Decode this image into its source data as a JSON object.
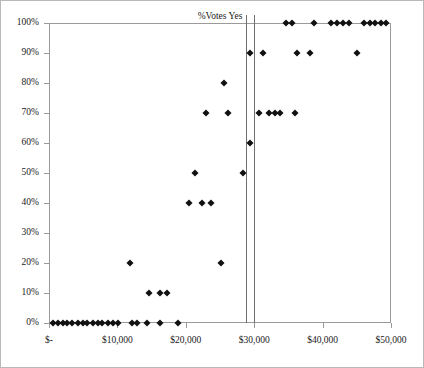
{
  "chart_data": {
    "type": "scatter",
    "title": "%Votes Yes",
    "xlabel": "",
    "ylabel": "",
    "xlim": [
      0,
      50000
    ],
    "ylim": [
      0,
      1.0
    ],
    "grid": false,
    "legend": null,
    "marker": "diamond",
    "marker_color": "#111111",
    "x_ticks": [
      0,
      10000,
      20000,
      30000,
      40000,
      50000
    ],
    "x_tick_labels": [
      "$-",
      "$10,000",
      "$20,000",
      "$30,000",
      "$40,000",
      "$50,000"
    ],
    "y_ticks": [
      0,
      0.1,
      0.2,
      0.3,
      0.4,
      0.5,
      0.6,
      0.7,
      0.8,
      0.9,
      1.0
    ],
    "y_tick_labels": [
      "0%",
      "10%",
      "20%",
      "30%",
      "40%",
      "50%",
      "60%",
      "70%",
      "80%",
      "90%",
      "100%"
    ],
    "reference_lines": [
      {
        "orientation": "vertical",
        "x": 28800,
        "color": "#6f6f6f"
      },
      {
        "orientation": "vertical",
        "x": 29900,
        "color": "#6f6f6f"
      }
    ],
    "points": [
      {
        "x": 600,
        "y": 0.0
      },
      {
        "x": 1300,
        "y": 0.0
      },
      {
        "x": 2000,
        "y": 0.0
      },
      {
        "x": 2700,
        "y": 0.0
      },
      {
        "x": 3400,
        "y": 0.0
      },
      {
        "x": 4200,
        "y": 0.0
      },
      {
        "x": 4900,
        "y": 0.0
      },
      {
        "x": 5600,
        "y": 0.0
      },
      {
        "x": 6400,
        "y": 0.0
      },
      {
        "x": 7100,
        "y": 0.0
      },
      {
        "x": 7800,
        "y": 0.0
      },
      {
        "x": 8600,
        "y": 0.0
      },
      {
        "x": 9300,
        "y": 0.0
      },
      {
        "x": 10100,
        "y": 0.0
      },
      {
        "x": 12100,
        "y": 0.0
      },
      {
        "x": 12900,
        "y": 0.0
      },
      {
        "x": 14400,
        "y": 0.0
      },
      {
        "x": 16200,
        "y": 0.0
      },
      {
        "x": 18800,
        "y": 0.0
      },
      {
        "x": 14600,
        "y": 0.1
      },
      {
        "x": 16300,
        "y": 0.1
      },
      {
        "x": 17300,
        "y": 0.1
      },
      {
        "x": 11900,
        "y": 0.2
      },
      {
        "x": 25100,
        "y": 0.2
      },
      {
        "x": 20500,
        "y": 0.4
      },
      {
        "x": 22300,
        "y": 0.4
      },
      {
        "x": 23700,
        "y": 0.4
      },
      {
        "x": 21400,
        "y": 0.5
      },
      {
        "x": 28300,
        "y": 0.5
      },
      {
        "x": 29400,
        "y": 0.6
      },
      {
        "x": 23000,
        "y": 0.7
      },
      {
        "x": 26200,
        "y": 0.7
      },
      {
        "x": 30700,
        "y": 0.7
      },
      {
        "x": 32200,
        "y": 0.7
      },
      {
        "x": 33000,
        "y": 0.7
      },
      {
        "x": 33700,
        "y": 0.7
      },
      {
        "x": 36000,
        "y": 0.7
      },
      {
        "x": 25600,
        "y": 0.8
      },
      {
        "x": 29400,
        "y": 0.9
      },
      {
        "x": 31300,
        "y": 0.9
      },
      {
        "x": 36300,
        "y": 0.9
      },
      {
        "x": 38200,
        "y": 0.9
      },
      {
        "x": 45000,
        "y": 0.9
      },
      {
        "x": 34700,
        "y": 1.0
      },
      {
        "x": 35500,
        "y": 1.0
      },
      {
        "x": 38800,
        "y": 1.0
      },
      {
        "x": 41200,
        "y": 1.0
      },
      {
        "x": 42100,
        "y": 1.0
      },
      {
        "x": 43000,
        "y": 1.0
      },
      {
        "x": 43800,
        "y": 1.0
      },
      {
        "x": 46000,
        "y": 1.0
      },
      {
        "x": 46900,
        "y": 1.0
      },
      {
        "x": 47700,
        "y": 1.0
      },
      {
        "x": 48500,
        "y": 1.0
      },
      {
        "x": 49300,
        "y": 1.0
      }
    ]
  }
}
